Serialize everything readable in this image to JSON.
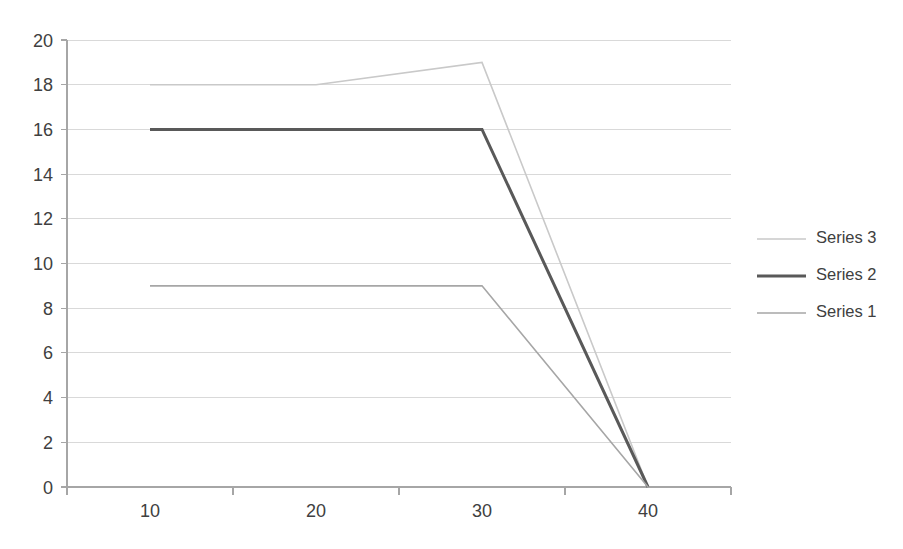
{
  "chart_data": {
    "type": "line",
    "title": "",
    "subtitle": "",
    "xlabel": "",
    "ylabel": "",
    "categories": [
      "10",
      "20",
      "30",
      "40"
    ],
    "series": [
      {
        "name": "Series 3",
        "values": [
          18,
          18,
          19,
          0
        ],
        "color": "#c9c9c9",
        "width": 1.6
      },
      {
        "name": "Series 2",
        "values": [
          16,
          16,
          16,
          0
        ],
        "color": "#595959",
        "width": 3.0
      },
      {
        "name": "Series 1",
        "values": [
          9,
          9,
          9,
          0
        ],
        "color": "#a6a6a6",
        "width": 1.6
      }
    ],
    "ylim": [
      0,
      20
    ],
    "ytick_values": [
      0,
      2,
      4,
      6,
      8,
      10,
      12,
      14,
      16,
      18,
      20
    ],
    "ytick_labels": [
      "0",
      "2",
      "4",
      "6",
      "8",
      "10",
      "12",
      "14",
      "16",
      "18",
      "20"
    ],
    "xtick_labels": [
      "10",
      "20",
      "30",
      "40"
    ],
    "grid": {
      "horizontal": true,
      "vertical": false,
      "color": "#d9d9d9"
    },
    "legend": {
      "position": "right",
      "entries": [
        {
          "label": "Series 3",
          "color": "#c9c9c9",
          "width": 1.6
        },
        {
          "label": "Series 2",
          "color": "#595959",
          "width": 3.0
        },
        {
          "label": "Series 1",
          "color": "#a6a6a6",
          "width": 1.6
        }
      ]
    },
    "axis": {
      "color": "#a6a6a6",
      "tick_color": "#a6a6a6",
      "label_color": "#404040"
    },
    "plot_area": {
      "left": 67,
      "right": 731,
      "top": 40,
      "bottom": 487
    },
    "background": "#ffffff"
  }
}
